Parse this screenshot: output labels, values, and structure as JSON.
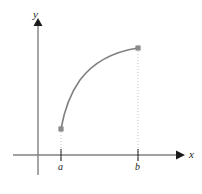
{
  "figure": {
    "background": "#ffffff",
    "width": 202,
    "height": 194
  },
  "axes": {
    "x_axis": {
      "label": "x",
      "icon": "arrow-right-icon",
      "color": "#808080",
      "arrow_color": "#1a1a1a",
      "pixel_y": 155,
      "pixel_x_start": 13,
      "pixel_x_end": 182
    },
    "y_axis": {
      "label": "y",
      "icon": "arrow-up-icon",
      "color": "#808080",
      "arrow_color": "#1a1a1a",
      "pixel_x": 38,
      "pixel_y_start": 20,
      "pixel_y_end": 175
    }
  },
  "ticks": [
    {
      "label": "a",
      "pixel_x": 61,
      "color": "#1a1a1a"
    },
    {
      "label": "b",
      "pixel_x": 138,
      "color": "#1a1a1a"
    }
  ],
  "guides": {
    "style": "dotted",
    "color": "#bdbdbd",
    "lines": [
      {
        "name": "guide-at-a",
        "pixel_x": 61,
        "pixel_y_top": 129,
        "pixel_y_bottom": 158
      },
      {
        "name": "guide-at-b",
        "pixel_x": 138,
        "pixel_y_top": 48,
        "pixel_y_bottom": 158
      }
    ]
  },
  "chart_data": {
    "type": "line",
    "title": "",
    "subtitle": "",
    "xlabel": "x",
    "ylabel": "y",
    "grid": false,
    "legend": null,
    "curve_color": "#808080",
    "curve_width": 1.6,
    "shape": "increasing concave-down (logarithmic / square-root like)",
    "domain_labels": [
      "a",
      "b"
    ],
    "endpoints": [
      {
        "name": "left-endpoint",
        "x_label": "a",
        "pixel_x": 61,
        "pixel_y": 129,
        "marker": "square",
        "marker_color": "#8c8c8c"
      },
      {
        "name": "right-endpoint",
        "x_label": "b",
        "pixel_x": 138,
        "pixel_y": 48,
        "marker": "square",
        "marker_color": "#8c8c8c"
      }
    ],
    "x": [
      61,
      64,
      68,
      72,
      77,
      82,
      88,
      95,
      103,
      112,
      121,
      130,
      138
    ],
    "y": [
      129,
      116,
      103,
      93,
      83,
      76,
      69,
      63,
      58,
      54,
      51,
      49,
      48
    ],
    "path": "M 61,129 C 64,112 70,94 80,80 C 92,64 112,52 138,48",
    "xlim": [
      38,
      182
    ],
    "ylim": [
      155,
      20
    ]
  }
}
